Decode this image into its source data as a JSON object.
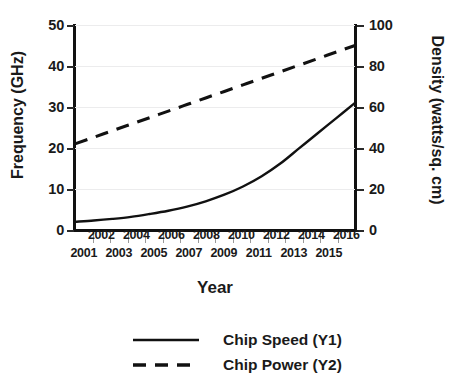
{
  "chart_data": {
    "type": "line",
    "title": "",
    "xlabel": "Year",
    "ylabel": "Frequency (GHz)",
    "y2label": "Density (watts/sq. cm)",
    "grid": true,
    "legend_position": "bottom",
    "x": [
      2001,
      2002,
      2003,
      2004,
      2005,
      2006,
      2007,
      2008,
      2009,
      2010,
      2011,
      2012,
      2013,
      2014,
      2015,
      2016
    ],
    "xlim": [
      2001,
      2016
    ],
    "xticklabels_even": [
      "2002",
      "2004",
      "2006",
      "2008",
      "2010",
      "2012",
      "2014",
      "2016"
    ],
    "xticklabels_odd": [
      "2001",
      "2003",
      "2005",
      "2007",
      "2009",
      "2011",
      "2013",
      "2015"
    ],
    "ylim": [
      0,
      50
    ],
    "yticklabels": [
      "0",
      "10",
      "20",
      "30",
      "40",
      "50"
    ],
    "yticks": [
      0,
      10,
      20,
      30,
      40,
      50
    ],
    "y2lim": [
      0,
      100
    ],
    "y2ticklabels": [
      "0",
      "20",
      "40",
      "60",
      "80",
      "100"
    ],
    "y2ticks": [
      0,
      20,
      40,
      60,
      80,
      100
    ],
    "series": [
      {
        "name": "Chip Speed (Y1)",
        "axis": "y1",
        "style": "solid",
        "color": "#111111",
        "values": [
          2.0,
          2.3,
          2.7,
          3.2,
          3.9,
          4.7,
          5.7,
          7.0,
          8.6,
          10.6,
          13.1,
          16.2,
          19.9,
          23.6,
          27.3,
          31.0
        ]
      },
      {
        "name": "Chip Power (Y2)",
        "axis": "y2",
        "style": "dashed",
        "color": "#111111",
        "values": [
          42.0,
          45.2,
          48.4,
          51.6,
          54.8,
          58.0,
          61.2,
          64.4,
          67.6,
          70.8,
          74.0,
          77.2,
          80.4,
          83.6,
          86.8,
          90.0
        ]
      }
    ]
  },
  "legend": {
    "items": [
      {
        "label": "Chip Speed (Y1)",
        "style": "solid"
      },
      {
        "label": "Chip Power (Y2)",
        "style": "dashed"
      }
    ]
  }
}
